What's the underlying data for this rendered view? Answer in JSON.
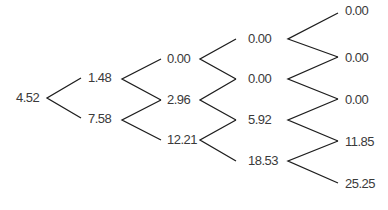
{
  "diagram": {
    "type": "binomial-tree",
    "steps": 4,
    "line_color": "#1e1e1e",
    "text_color": "#3a3a3a",
    "levels": [
      [
        "4.52"
      ],
      [
        "1.48",
        "7.58"
      ],
      [
        "0.00",
        "2.96",
        "12.21"
      ],
      [
        "0.00",
        "0.00",
        "5.92",
        "18.53"
      ],
      [
        "0.00",
        "0.00",
        "0.00",
        "11.85",
        "25.25"
      ]
    ]
  }
}
